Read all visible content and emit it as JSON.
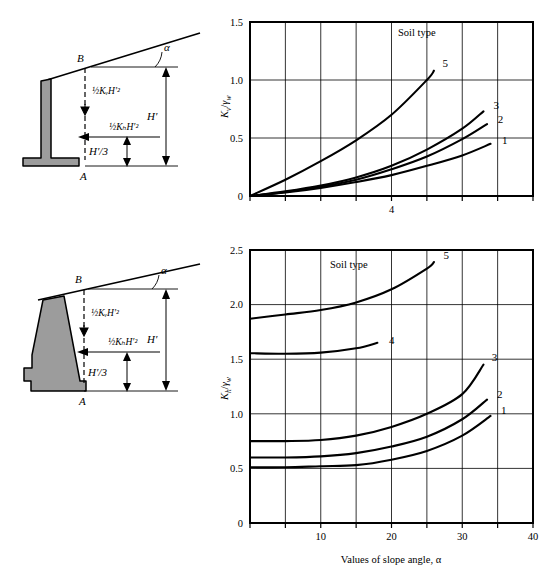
{
  "figure": {
    "background": "#ffffff",
    "ink": "#000000",
    "wall_fill": "#9c9c9c"
  },
  "diagrams": [
    {
      "id": "cantilever-wall",
      "point_top": "B",
      "point_bottom": "A",
      "angle_label": "α",
      "vertical_force_label": "½KᵥH′²",
      "horizontal_force_label": "½KₕH′²",
      "height_label": "H′",
      "third_height_label": "H′/3",
      "wall_type": "cantilever"
    },
    {
      "id": "gravity-wall",
      "point_top": "B",
      "point_bottom": "A",
      "angle_label": "α",
      "vertical_force_label": "½KᵥH′²",
      "horizontal_force_label": "½KₕH′²",
      "height_label": "H′",
      "third_height_label": "H′/3",
      "wall_type": "gravity"
    }
  ],
  "chart_data": [
    {
      "type": "line",
      "id": "kv-chart",
      "title": "",
      "legend_title": "Soil type",
      "legend_position": "inside-top-right",
      "xlabel": "",
      "ylabel": "Kᵥ/γₑ",
      "ylabel_parts": {
        "main": "K",
        "sub": "v",
        "denom": "γ",
        "denom_sub": "w"
      },
      "xlim": [
        0,
        40
      ],
      "ylim": [
        0,
        1.5
      ],
      "xticks": [
        0,
        5,
        10,
        15,
        20,
        25,
        30,
        35,
        40
      ],
      "xtick_labels": [
        "",
        "",
        "",
        "",
        "4",
        "",
        "",
        "",
        ""
      ],
      "visible_xtick_label": "4",
      "yticks": [
        0,
        0.5,
        1.0,
        1.5
      ],
      "ytick_labels": [
        "0",
        "0.5",
        "1.0",
        "1.5"
      ],
      "grid": true,
      "series": [
        {
          "name": "1",
          "label": "1",
          "x": [
            0,
            5,
            10,
            15,
            20,
            25,
            30,
            34
          ],
          "y": [
            0.0,
            0.03,
            0.07,
            0.12,
            0.18,
            0.26,
            0.35,
            0.45
          ]
        },
        {
          "name": "2",
          "label": "2",
          "x": [
            0,
            5,
            10,
            15,
            20,
            25,
            30,
            33.5
          ],
          "y": [
            0.0,
            0.035,
            0.08,
            0.14,
            0.23,
            0.34,
            0.49,
            0.62
          ]
        },
        {
          "name": "3",
          "label": "3",
          "x": [
            0,
            5,
            10,
            15,
            20,
            25,
            30,
            33
          ],
          "y": [
            0.0,
            0.04,
            0.09,
            0.16,
            0.26,
            0.4,
            0.58,
            0.73
          ]
        },
        {
          "name": "5",
          "label": "5",
          "x": [
            0,
            5,
            10,
            15,
            20,
            25,
            26
          ],
          "y": [
            0.0,
            0.14,
            0.3,
            0.48,
            0.7,
            1.0,
            1.08
          ]
        }
      ]
    },
    {
      "type": "line",
      "id": "kh-chart",
      "title": "",
      "legend_title": "Soil type",
      "legend_position": "inside-top-left",
      "xlabel": "Values of slope angle, α",
      "ylabel": "Kₕ/γₑ",
      "ylabel_parts": {
        "main": "K",
        "sub": "h",
        "denom": "γ",
        "denom_sub": "w"
      },
      "xlim": [
        0,
        40
      ],
      "ylim": [
        0,
        2.5
      ],
      "xticks": [
        0,
        5,
        10,
        15,
        20,
        25,
        30,
        35,
        40
      ],
      "xtick_labels": [
        "",
        "",
        "10",
        "",
        "20",
        "",
        "30",
        "",
        "40"
      ],
      "yticks": [
        0,
        0.5,
        1.0,
        1.5,
        2.0,
        2.5
      ],
      "ytick_labels": [
        "0",
        "0.5",
        "1.0",
        "1.5",
        "2.0",
        "2.5"
      ],
      "grid": true,
      "series": [
        {
          "name": "1",
          "label": "1",
          "x": [
            0,
            5,
            10,
            15,
            20,
            25,
            30,
            34
          ],
          "y": [
            0.51,
            0.51,
            0.52,
            0.53,
            0.58,
            0.66,
            0.8,
            0.98
          ]
        },
        {
          "name": "2",
          "label": "2",
          "x": [
            0,
            5,
            10,
            15,
            20,
            25,
            30,
            33.5
          ],
          "y": [
            0.6,
            0.6,
            0.61,
            0.64,
            0.7,
            0.79,
            0.95,
            1.13
          ]
        },
        {
          "name": "3",
          "label": "3",
          "x": [
            0,
            5,
            10,
            15,
            20,
            25,
            30,
            33
          ],
          "y": [
            0.75,
            0.75,
            0.76,
            0.8,
            0.88,
            1.0,
            1.18,
            1.45
          ]
        },
        {
          "name": "4",
          "label": "4",
          "x": [
            0,
            5,
            10,
            15,
            18
          ],
          "y": [
            1.555,
            1.55,
            1.56,
            1.6,
            1.65
          ]
        },
        {
          "name": "5",
          "label": "5",
          "x": [
            0,
            5,
            10,
            15,
            20,
            25,
            26
          ],
          "y": [
            1.87,
            1.91,
            1.95,
            2.02,
            2.14,
            2.33,
            2.39
          ]
        }
      ]
    }
  ]
}
